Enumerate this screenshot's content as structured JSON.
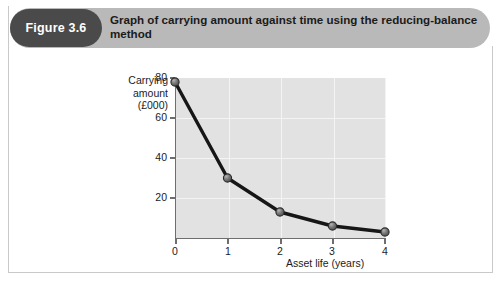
{
  "figure": {
    "badge_label": "Figure 3.6",
    "title": "Graph of carrying amount against time using the reducing-balance method",
    "badge_color": "#4a4a4a",
    "header_color": "#b9b9b9"
  },
  "chart_data": {
    "type": "line",
    "title": "Graph of carrying amount against time using the reducing-balance method",
    "xlabel": "Asset life (years)",
    "ylabel": "Carrying amount (£000)",
    "ylabel_lines": [
      "Carrying",
      "amount",
      "(£000)"
    ],
    "x": [
      0,
      1,
      2,
      3,
      4
    ],
    "values": [
      78,
      30,
      13,
      6,
      3
    ],
    "xtick_labels": [
      "0",
      "1",
      "2",
      "3",
      "4"
    ],
    "ytick_labels": [
      "20",
      "40",
      "60",
      "80"
    ],
    "yticks": [
      20,
      40,
      60,
      80
    ],
    "xlim": [
      0,
      4
    ],
    "ylim": [
      0,
      80
    ],
    "grid": true,
    "legend": "none",
    "line_color": "#1a1a1a",
    "marker_color": "#6b6b6b",
    "plot_background": "#e2e2e2",
    "gridline_color": "#f4f4f4"
  }
}
